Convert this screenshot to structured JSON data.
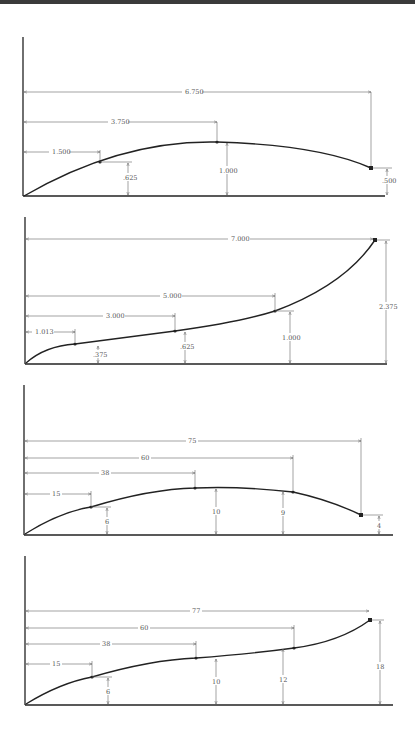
{
  "panels": [
    {
      "id": "panel-1",
      "horizontal_dims": [
        "1.500",
        "3.750",
        "6.750"
      ],
      "vertical_dims": [
        ".625",
        "1.000",
        ".500"
      ]
    },
    {
      "id": "panel-2",
      "horizontal_dims": [
        "1.013",
        "3.000",
        "5.000",
        "7.000"
      ],
      "vertical_dims": [
        ".375",
        ".625",
        "1.000",
        "2.375"
      ]
    },
    {
      "id": "panel-3",
      "horizontal_dims": [
        "15",
        "38",
        "60",
        "75"
      ],
      "vertical_dims": [
        "6",
        "10",
        "9",
        "4"
      ]
    },
    {
      "id": "panel-4",
      "horizontal_dims": [
        "15",
        "38",
        "60",
        "77"
      ],
      "vertical_dims": [
        "6",
        "10",
        "12",
        "18"
      ]
    }
  ]
}
